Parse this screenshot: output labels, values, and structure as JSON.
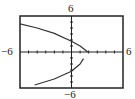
{
  "chart_data": {
    "type": "line",
    "title": "",
    "xlabel": "",
    "ylabel": "",
    "xlim": [
      -6,
      6
    ],
    "ylim": [
      -6,
      6
    ],
    "grid": false,
    "axis_tick_spacing": 1,
    "window_labels": {
      "top": "6",
      "bottom": "−6",
      "left": "−6",
      "right": "6"
    },
    "series": [
      {
        "name": "upper-branch",
        "points": [
          [
            -6,
            4.7
          ],
          [
            -4,
            4.0
          ],
          [
            -2,
            3.1
          ],
          [
            0,
            1.8
          ],
          [
            1,
            1.0
          ],
          [
            1.9,
            0
          ]
        ]
      },
      {
        "name": "lower-branch",
        "points": [
          [
            1.4,
            -1.1
          ],
          [
            1,
            -2.0
          ],
          [
            0,
            -3.2
          ],
          [
            -2,
            -4.5
          ],
          [
            -4.3,
            -5.5
          ]
        ]
      }
    ],
    "annotations": [
      "vertex near (2, 0)",
      "gap in curve just below vertex"
    ]
  },
  "colors": {
    "frame": "#222222",
    "curve": "#333333",
    "axes": "#222222",
    "background": "#ffffff"
  }
}
